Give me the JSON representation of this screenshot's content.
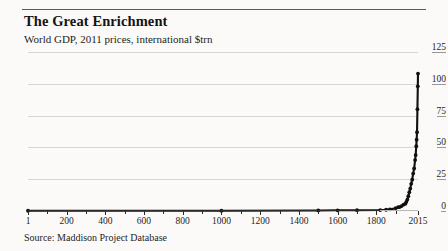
{
  "header": {
    "title": "The Great Enrichment",
    "subtitle": "World GDP, 2011 prices, international $trn"
  },
  "footer": {
    "source": "Source: Maddison Project Database"
  },
  "chart_data": {
    "type": "line",
    "title": "The Great Enrichment",
    "subtitle": "World GDP, 2011 prices, international $trn",
    "xlabel": "",
    "ylabel": "",
    "ylim": [
      0,
      125
    ],
    "xlim": [
      1,
      2015
    ],
    "grid": true,
    "legend": false,
    "y_axis_side": "right",
    "ytick_labels": [
      "0",
      "25",
      "50",
      "75",
      "100",
      "125"
    ],
    "ytick_values": [
      0,
      25,
      50,
      75,
      100,
      125
    ],
    "xtick_labels": [
      "1",
      "200",
      "400",
      "600",
      "800",
      "1000",
      "1200",
      "1400",
      "1600",
      "1800",
      "2015"
    ],
    "xtick_values": [
      1,
      200,
      400,
      600,
      800,
      1000,
      1200,
      1400,
      1600,
      1800,
      2015
    ],
    "minor_xticks": [
      100,
      300,
      500,
      700,
      900,
      1100,
      1300,
      1500,
      1700,
      1900
    ],
    "marker": "circle",
    "series": [
      {
        "name": "World GDP",
        "x": [
          1,
          1000,
          1500,
          1600,
          1700,
          1820,
          1850,
          1870,
          1900,
          1913,
          1920,
          1930,
          1940,
          1950,
          1955,
          1960,
          1965,
          1970,
          1975,
          1980,
          1985,
          1990,
          1995,
          2000,
          2003,
          2006,
          2008,
          2010,
          2012,
          2014,
          2015
        ],
        "values": [
          0.18,
          0.21,
          0.43,
          0.55,
          0.64,
          0.75,
          1.0,
          1.3,
          2.2,
          3.0,
          3.1,
          3.9,
          5.0,
          5.7,
          7.2,
          9.0,
          11.6,
          14.8,
          17.6,
          21.4,
          24.6,
          29.4,
          33.4,
          40.0,
          44.0,
          51.0,
          56.0,
          62.0,
          80.0,
          98.0,
          108.0
        ]
      }
    ],
    "annotations": [],
    "colors": {
      "series": "#101010",
      "gridline": "#d8d6d2",
      "axis": "#2b2b2b",
      "background": "#fbfaf8",
      "text": "#1a1a1a"
    }
  }
}
